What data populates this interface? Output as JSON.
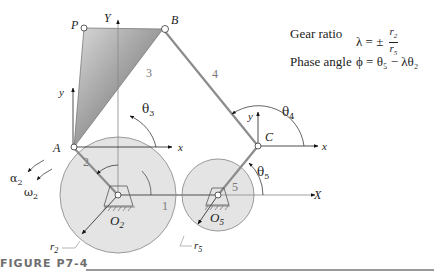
{
  "figure": {
    "caption": "FIGURE P7-4",
    "points": {
      "P": "P",
      "B": "B",
      "A": "A",
      "C": "C",
      "O2": "O",
      "O2_sub": "2",
      "O5": "O",
      "O5_sub": "5"
    },
    "axes": {
      "Y": "Y",
      "X": "X",
      "x_A": "x",
      "y_A": "y",
      "x_C": "x",
      "y_C": "y"
    },
    "links": {
      "l1": "1",
      "l2": "2",
      "l3": "3",
      "l4": "4",
      "l5": "5"
    },
    "angles": {
      "theta": "θ",
      "theta3_sub": "3",
      "theta4_sub": "4",
      "theta5_sub": "5",
      "alpha": "α",
      "alpha2_sub": "2",
      "omega": "ω",
      "omega2_sub": "2"
    },
    "radii": {
      "r": "r",
      "r2_sub": "2",
      "r5_sub": "5"
    },
    "colors": {
      "gear": "#e2e2e2",
      "gear_stroke": "#9a9a9a",
      "link": "#8c8c8c",
      "coupler_dark": "#6a6a6a",
      "coupler_light": "#d8d8d8"
    }
  },
  "equations": {
    "gear_ratio_label": "Gear ratio",
    "gear_ratio_lhs": "λ = ±",
    "gear_ratio_num_r": "r",
    "gear_ratio_num_sub": "2",
    "gear_ratio_den_r": "r",
    "gear_ratio_den_sub": "5",
    "phase_angle_label": "Phase angle",
    "phase_angle_expr": "ϕ = θ₅ − λθ₂"
  }
}
